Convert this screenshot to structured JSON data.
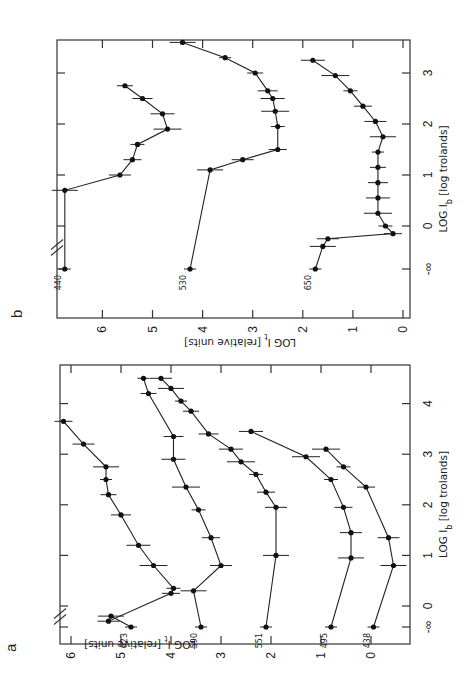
{
  "figure": {
    "orientation": "rotated 90 degrees counter-clockwise",
    "panels": [
      "a",
      "b"
    ]
  },
  "chart_data": [
    {
      "panel": "a",
      "type": "line",
      "title": "",
      "xlabel": "LOG I_b [log trolands]",
      "ylabel": "LOG I_t [relative units]",
      "x_ticks": [
        "-∞",
        "0",
        "1",
        "2",
        "3",
        "4"
      ],
      "y_ticks": [
        "0",
        "1",
        "2",
        "3",
        "4",
        "5",
        "6"
      ],
      "xlim": [
        -0.75,
        4.75
      ],
      "ylim": [
        -0.75,
        6.3
      ],
      "error_bars": true,
      "axis_break": "between -∞ and 0 on x-axis",
      "series": [
        {
          "name": "623",
          "x": [
            "-∞",
            -0.2,
            -0.3,
            0.25,
            0.35,
            0.8,
            1.2,
            1.8,
            2.2,
            2.5,
            2.75,
            3.2,
            3.65
          ],
          "y": [
            4.8,
            5.2,
            5.25,
            4.0,
            3.95,
            4.35,
            4.65,
            5.0,
            5.25,
            5.3,
            5.3,
            5.75,
            6.15
          ]
        },
        {
          "name": "590",
          "x": [
            "-∞",
            0.3,
            0.8,
            1.35,
            1.9,
            2.35,
            2.9,
            3.35,
            4.2,
            4.5
          ],
          "y": [
            3.4,
            3.55,
            3.0,
            3.2,
            3.45,
            3.7,
            3.95,
            3.95,
            4.45,
            4.55
          ]
        },
        {
          "name": "551",
          "x": [
            "-∞",
            1.0,
            1.95,
            2.25,
            2.6,
            2.85,
            3.1,
            3.4,
            3.85,
            4.05,
            4.3,
            4.5
          ],
          "y": [
            2.1,
            1.9,
            1.9,
            2.1,
            2.3,
            2.6,
            2.8,
            3.25,
            3.6,
            3.8,
            4.0,
            4.2
          ]
        },
        {
          "name": "495",
          "x": [
            "-∞",
            0.95,
            1.45,
            1.95,
            2.5,
            2.95,
            3.45
          ],
          "y": [
            0.8,
            0.4,
            0.4,
            0.55,
            0.8,
            1.3,
            2.4
          ]
        },
        {
          "name": "438",
          "x": [
            "-∞",
            0.8,
            1.35,
            2.35,
            2.75,
            3.1
          ],
          "y": [
            -0.05,
            -0.45,
            -0.35,
            0.1,
            0.55,
            0.9
          ]
        }
      ]
    },
    {
      "panel": "b",
      "type": "line",
      "title": "",
      "xlabel": "LOG I_b [log trolands]",
      "ylabel": "LOG I_t [relative units]",
      "x_ticks": [
        "-∞",
        "0",
        "1",
        "2",
        "3"
      ],
      "y_ticks": [
        "0",
        "1",
        "2",
        "3",
        "4",
        "5",
        "6"
      ],
      "xlim": [
        -1.6,
        3.75
      ],
      "ylim": [
        -0.05,
        6.9
      ],
      "error_bars": true,
      "axis_break": "between -∞ and 0 on x-axis",
      "series": [
        {
          "name": "440",
          "x": [
            "-∞",
            0.7,
            1.0,
            1.3,
            1.6,
            1.9,
            2.2,
            2.5,
            2.75
          ],
          "y": [
            6.75,
            6.75,
            5.65,
            5.4,
            5.3,
            4.7,
            4.8,
            5.2,
            5.55
          ]
        },
        {
          "name": "530",
          "x": [
            "-∞",
            1.1,
            1.3,
            1.5,
            1.95,
            2.25,
            2.5,
            2.65,
            3.0,
            3.3,
            3.6
          ],
          "y": [
            4.25,
            3.85,
            3.2,
            2.5,
            2.5,
            2.55,
            2.6,
            2.7,
            2.95,
            3.55,
            4.4
          ]
        },
        {
          "name": "650",
          "x": [
            "-∞",
            -0.4,
            -0.25,
            -0.15,
            0.0,
            0.25,
            0.55,
            0.85,
            1.15,
            1.45,
            1.75,
            2.05,
            2.35,
            2.65,
            2.95,
            3.25
          ],
          "y": [
            1.75,
            1.6,
            1.5,
            0.2,
            0.35,
            0.5,
            0.5,
            0.5,
            0.5,
            0.5,
            0.4,
            0.55,
            0.8,
            1.05,
            1.35,
            1.8
          ]
        }
      ]
    }
  ],
  "labels": {
    "panel_a": "a",
    "panel_b": "b",
    "x_title_prefix": "LOG I",
    "x_title_sub": "b",
    "x_title_suffix": " [log trolands]",
    "y_title_prefix": "LOG I",
    "y_title_sub": "t",
    "y_title_suffix": " [relative units]"
  }
}
